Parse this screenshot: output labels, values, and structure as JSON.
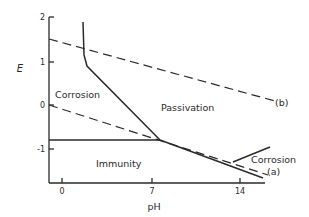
{
  "diagram": {
    "y_axis": {
      "label": "E",
      "ticks": [
        {
          "value": "2",
          "y": 17
        },
        {
          "value": "1",
          "y": 62
        },
        {
          "value": "0",
          "y": 105
        },
        {
          "value": "-1",
          "y": 149
        }
      ]
    },
    "x_axis": {
      "label": "pH",
      "ticks": [
        {
          "value": "0",
          "x": 62
        },
        {
          "value": "7",
          "x": 152
        },
        {
          "value": "14",
          "x": 240
        }
      ]
    },
    "regions": {
      "corrosion_left": "Corrosion",
      "passivation": "Passivation",
      "immunity": "Immunity",
      "corrosion_right": "Corrosion"
    },
    "line_labels": {
      "a": "(a)",
      "b": "(b)"
    },
    "colors": {
      "line": "#2a2a2a",
      "background": "#ffffff"
    }
  }
}
